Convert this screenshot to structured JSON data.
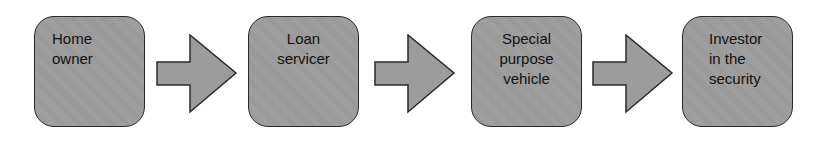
{
  "diagram": {
    "type": "flowchart",
    "direction": "left-to-right",
    "colors": {
      "node_fill": "#9c9c9c",
      "node_stroke": "#2a2a2a",
      "arrow_fill": "#9c9c9c",
      "arrow_stroke": "#2a2a2a",
      "text": "#111111",
      "background": "#ffffff"
    },
    "nodes": [
      {
        "id": "home-owner",
        "label": "Home\nowner"
      },
      {
        "id": "loan-servicer",
        "label": "Loan\nservicer"
      },
      {
        "id": "special-purpose-vehicle",
        "label": "Special\npurpose\nvehicle"
      },
      {
        "id": "investor-in-the-security",
        "label": "Investor\nin the\nsecurity"
      }
    ],
    "edges": [
      {
        "from": "home-owner",
        "to": "loan-servicer",
        "shape": "block-arrow"
      },
      {
        "from": "loan-servicer",
        "to": "special-purpose-vehicle",
        "shape": "block-arrow"
      },
      {
        "from": "special-purpose-vehicle",
        "to": "investor-in-the-security",
        "shape": "block-arrow"
      }
    ]
  }
}
